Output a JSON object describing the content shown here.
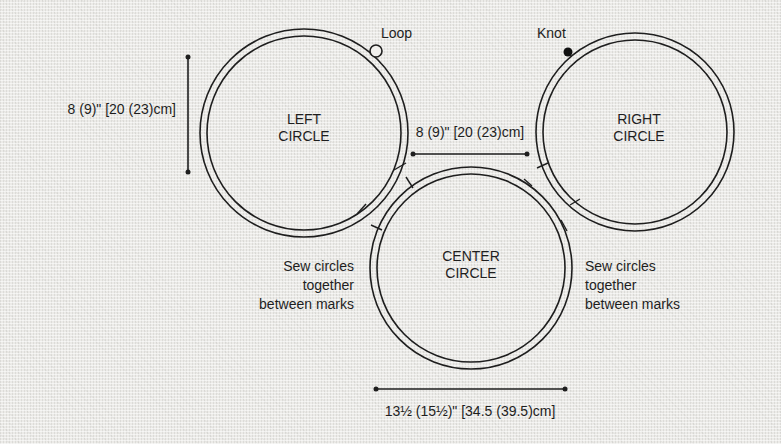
{
  "diagram": {
    "colors": {
      "line": "#1e1e1e",
      "background": "#ecebe8"
    },
    "circles": [
      {
        "id": "left",
        "label_line1": "LEFT",
        "label_line2": "CIRCLE"
      },
      {
        "id": "center",
        "label_line1": "CENTER",
        "label_line2": "CIRCLE"
      },
      {
        "id": "right",
        "label_line1": "RIGHT",
        "label_line2": "CIRCLE"
      }
    ],
    "markers": {
      "loop_label": "Loop",
      "knot_label": "Knot"
    },
    "dimensions": {
      "left_height": "8 (9)\" [20 (23)cm]",
      "gap_width": "8 (9)\" [20 (23)cm]",
      "center_width": "13½ (15½)\" [34.5 (39.5)cm]"
    },
    "notes": {
      "left": {
        "line1": "Sew circles",
        "line2": "together",
        "line3": "between marks"
      },
      "right": {
        "line1": "Sew circles",
        "line2": "together",
        "line3": "between marks"
      }
    }
  }
}
